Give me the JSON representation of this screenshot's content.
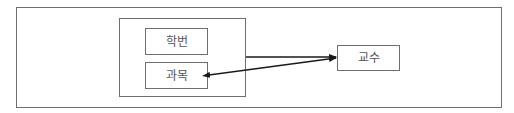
{
  "diagram": {
    "type": "dependency-diagram",
    "colors": {
      "border": "#6e6e6e",
      "arrow": "#1a1a1a",
      "text": "#555555",
      "background": "#ffffff"
    },
    "outer_frame": {
      "x": 16,
      "y": 7,
      "w": 486,
      "h": 101
    },
    "group": {
      "x": 119,
      "y": 18,
      "w": 127,
      "h": 79
    },
    "nodes": [
      {
        "id": "student_id",
        "label": "학번",
        "x": 145,
        "y": 28,
        "w": 63,
        "h": 27
      },
      {
        "id": "subject",
        "label": "과목",
        "x": 145,
        "y": 62,
        "w": 63,
        "h": 27
      },
      {
        "id": "professor",
        "label": "교수",
        "x": 337,
        "y": 45,
        "w": 63,
        "h": 26
      }
    ],
    "edges": [
      {
        "from": "group(학번,과목)",
        "to": "교수",
        "style": "single-arrow"
      },
      {
        "from": "교수",
        "to": "과목",
        "style": "double-arrow"
      }
    ]
  }
}
